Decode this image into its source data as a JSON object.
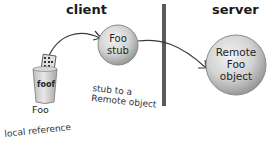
{
  "headings": {
    "client": "client",
    "server": "server"
  },
  "nodes": {
    "stub": {
      "line1": "Foo",
      "line2": "stub"
    },
    "remote": {
      "line1": "Remote",
      "line2": "Foo",
      "line3": "object"
    },
    "cup_label": "foof",
    "foo_label": "Foo"
  },
  "annotations": {
    "stub_note_line1": "stub to a",
    "stub_note_line2": "Remote object",
    "local_ref": "local reference"
  },
  "colors": {
    "divider": "#5a5a5a",
    "circle_fill": "#cfcfcf",
    "circle_edge": "#8a8a8a",
    "arrow": "#3a3a3a"
  }
}
